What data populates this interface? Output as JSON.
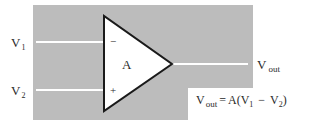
{
  "diagram": {
    "type": "op-amp-schematic",
    "colors": {
      "background_panel": "#bcbcbc",
      "wire": "#ffffff",
      "triangle_fill": "#ffffff",
      "triangle_stroke": "#1a1a1a",
      "text": "#2a2a2a"
    },
    "inputs": [
      {
        "name": "V",
        "subscript": "1",
        "terminal_sign": "−"
      },
      {
        "name": "V",
        "subscript": "2",
        "terminal_sign": "+"
      }
    ],
    "amplifier": {
      "gain_label": "A"
    },
    "output": {
      "name": "V",
      "subscript": "out"
    },
    "equation": {
      "lhs_name": "V",
      "lhs_subscript": "out",
      "equals": "=",
      "gain": "A(",
      "v1_name": "V",
      "v1_subscript": "1",
      "minus": "−",
      "v2_name": "V",
      "v2_subscript": "2",
      "close": ")"
    }
  }
}
